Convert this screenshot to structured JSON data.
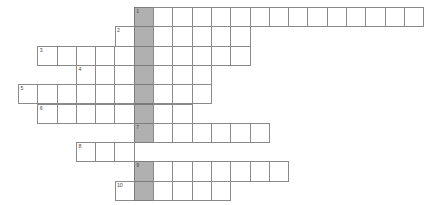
{
  "puzzle": {
    "kind": "crossword-grid",
    "title": "Crossword puzzle grid",
    "cell_size_px": 19.3,
    "origin_x_px": 18,
    "origin_y_px": 7,
    "colors": {
      "cell_fill": "#ffffff",
      "cell_border": "#8a8a8a",
      "highlight_fill": "#b0b0b0",
      "highlight_border": "#7c7c7c",
      "number_text": "#4a4a4a",
      "background": "#ffffff"
    },
    "highlight_column_index": 6,
    "row_count": 10,
    "column_count": 21,
    "rows": [
      {
        "number": "1",
        "start_col": 6,
        "length": 15,
        "cells": [
          "",
          "",
          "",
          "",
          "",
          "",
          "",
          "",
          "",
          "",
          "",
          "",
          "",
          "",
          ""
        ]
      },
      {
        "number": "2",
        "start_col": 5,
        "length": 7,
        "cells": [
          "",
          "",
          "",
          "",
          "",
          "",
          ""
        ]
      },
      {
        "number": "3",
        "start_col": 1,
        "length": 11,
        "cells": [
          "",
          "",
          "",
          "",
          "",
          "",
          "",
          "",
          "",
          "",
          ""
        ]
      },
      {
        "number": "4",
        "start_col": 3,
        "length": 7,
        "cells": [
          "",
          "",
          "",
          "",
          "",
          "",
          ""
        ]
      },
      {
        "number": "5",
        "start_col": 0,
        "length": 10,
        "cells": [
          "",
          "",
          "",
          "",
          "",
          "",
          "",
          "",
          "",
          ""
        ]
      },
      {
        "number": "6",
        "start_col": 1,
        "length": 8,
        "cells": [
          "",
          "",
          "",
          "",
          "",
          "",
          "",
          ""
        ]
      },
      {
        "number": "7",
        "start_col": 6,
        "length": 7,
        "cells": [
          "",
          "",
          "",
          "",
          "",
          "",
          ""
        ]
      },
      {
        "number": "8",
        "start_col": 3,
        "length": 3,
        "cells": [
          "",
          "",
          ""
        ]
      },
      {
        "number": "9",
        "start_col": 6,
        "length": 8,
        "cells": [
          "",
          "",
          "",
          "",
          "",
          "",
          "",
          ""
        ]
      },
      {
        "number": "10",
        "start_col": 5,
        "length": 6,
        "cells": [
          "",
          "",
          "",
          "",
          "",
          ""
        ]
      }
    ]
  }
}
